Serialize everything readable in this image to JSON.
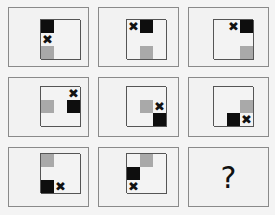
{
  "puzzle": {
    "type": "3x3 matrix reasoning",
    "legend": {
      "black": "#0e0e0e",
      "gray": "#a9a9a9",
      "x": "✖"
    },
    "panels": [
      {
        "id": 1,
        "black": [
          0,
          0
        ],
        "x": [
          1,
          0
        ],
        "gray": [
          2,
          0
        ]
      },
      {
        "id": 2,
        "black": [
          0,
          1
        ],
        "x": [
          0,
          0
        ],
        "gray": [
          2,
          1
        ]
      },
      {
        "id": 3,
        "black": [
          0,
          2
        ],
        "x": [
          0,
          1
        ],
        "gray": [
          2,
          2
        ]
      },
      {
        "id": 4,
        "black": [
          1,
          2
        ],
        "x": [
          0,
          2
        ],
        "gray": [
          1,
          0
        ]
      },
      {
        "id": 5,
        "black": [
          2,
          2
        ],
        "x": [
          1,
          2
        ],
        "gray": [
          1,
          1
        ]
      },
      {
        "id": 6,
        "black": [
          2,
          1
        ],
        "x": [
          2,
          2
        ],
        "gray": [
          1,
          2
        ]
      },
      {
        "id": 7,
        "black": [
          2,
          0
        ],
        "x": [
          2,
          1
        ],
        "gray": [
          0,
          0
        ]
      },
      {
        "id": 8,
        "black": [
          1,
          0
        ],
        "x": [
          2,
          0
        ],
        "gray": [
          0,
          1
        ]
      },
      {
        "id": 9,
        "question": "?"
      }
    ]
  }
}
